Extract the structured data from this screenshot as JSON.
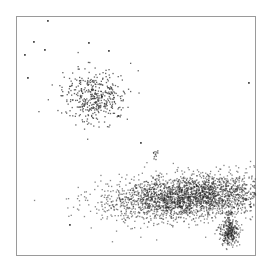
{
  "chart_data": {
    "type": "scatter",
    "title": "",
    "xlabel": "",
    "ylabel": "",
    "grid": false,
    "legend": null,
    "frame": {
      "x": 16,
      "y": 16,
      "width": 240,
      "height": 240,
      "color": "#9a9a9a"
    },
    "xlim": [
      0,
      240
    ],
    "ylim": [
      0,
      240
    ],
    "point_color": "#222222",
    "clusters": [
      {
        "name": "upper-left population",
        "cx": 78,
        "cy": 96,
        "sx": 16,
        "sy": 13,
        "n": 420,
        "density": "sparse"
      },
      {
        "name": "lower main population",
        "cx": 175,
        "cy": 196,
        "sx": 40,
        "sy": 11,
        "n": 2600,
        "density": "dense"
      },
      {
        "name": "lower-right compact population",
        "cx": 213,
        "cy": 232,
        "sx": 5,
        "sy": 6,
        "n": 320,
        "density": "dense"
      },
      {
        "name": "small cluster",
        "cx": 139,
        "cy": 155,
        "sx": 2,
        "sy": 3,
        "n": 12,
        "density": "small"
      }
    ],
    "outliers": [
      [
        47,
        20
      ],
      [
        33,
        41
      ],
      [
        88,
        42
      ],
      [
        44,
        49
      ],
      [
        24,
        54
      ],
      [
        108,
        50
      ],
      [
        248,
        82
      ],
      [
        140,
        142
      ],
      [
        250,
        206
      ],
      [
        223,
        240
      ],
      [
        69,
        224
      ],
      [
        27,
        77
      ]
    ]
  }
}
